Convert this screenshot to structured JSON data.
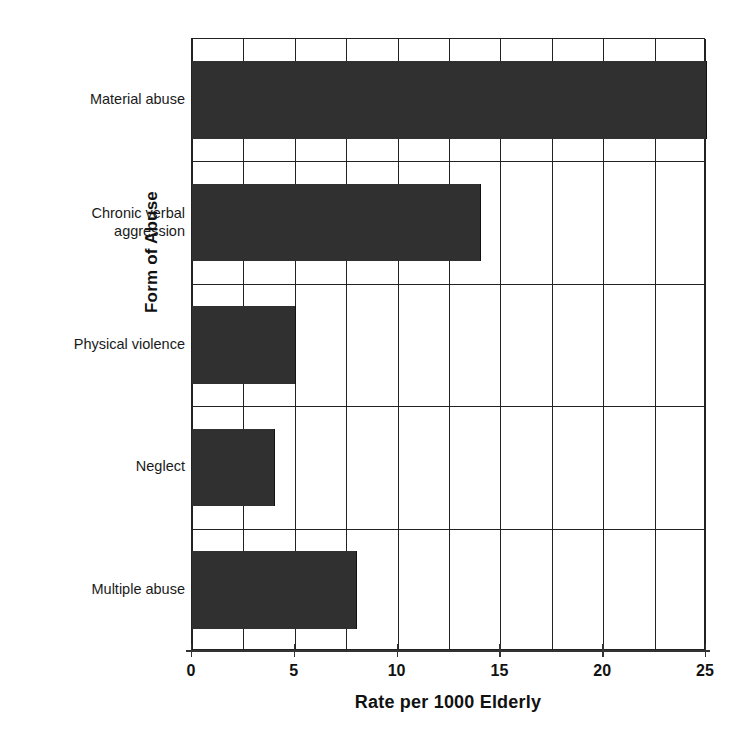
{
  "chart_data": {
    "type": "bar",
    "orientation": "horizontal",
    "title": "",
    "xlabel": "Rate per 1000 Elderly",
    "ylabel": "Form of Abuse",
    "categories": [
      "Material abuse",
      "Chronic verbal aggression",
      "Physical violence",
      "Neglect",
      "Multiple abuse"
    ],
    "category_lines": [
      [
        "Material abuse"
      ],
      [
        "Chronic verbal",
        "aggression"
      ],
      [
        "Physical violence"
      ],
      [
        "Neglect"
      ],
      [
        "Multiple abuse"
      ]
    ],
    "values": [
      25,
      14,
      5,
      4,
      8
    ],
    "xlim": [
      0,
      25
    ],
    "xticks": [
      0,
      5,
      10,
      15,
      20,
      25
    ],
    "xticklabels": [
      "0",
      "5",
      "10",
      "15",
      "20",
      "25"
    ],
    "minor_gridline_step": 2.5,
    "grid": true,
    "legend": null,
    "bar_color": "#303030",
    "grid_color": "#222222",
    "axis_color": "#333333",
    "background": "#ffffff"
  }
}
